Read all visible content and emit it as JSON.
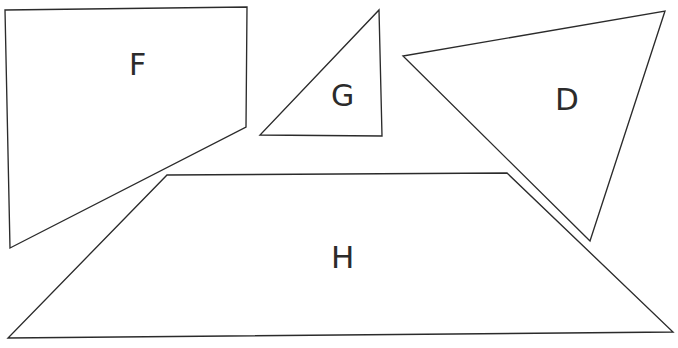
{
  "diagram": {
    "background_color": "#ffffff",
    "stroke_color": "#2b2b2b",
    "width": 678,
    "height": 348,
    "shapes": [
      {
        "id": "F",
        "label": "F",
        "type": "quadrilateral",
        "points": "5,10 247,7 246,127 10,248",
        "label_x": 129,
        "label_y": 50
      },
      {
        "id": "G",
        "label": "G",
        "type": "triangle",
        "points": "379,10 382,136 260,135",
        "label_x": 331,
        "label_y": 81
      },
      {
        "id": "D",
        "label": "D",
        "type": "triangle",
        "points": "665,11 590,241 403,56",
        "label_x": 555,
        "label_y": 84
      },
      {
        "id": "H",
        "label": "H",
        "type": "trapezoid",
        "points": "167,175 507,173 673,332 8,338",
        "label_x": 331,
        "label_y": 242
      }
    ]
  }
}
